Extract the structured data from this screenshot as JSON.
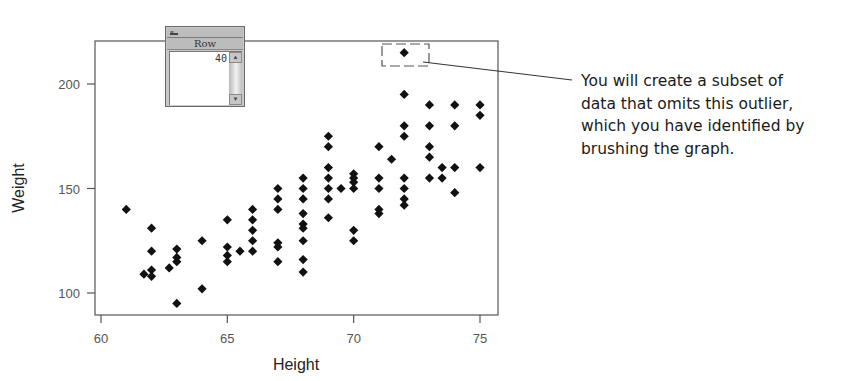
{
  "chart_data": {
    "type": "scatter",
    "title": "",
    "xlabel": "Height",
    "ylabel": "Weight",
    "xlim": [
      59.75,
      75.75
    ],
    "ylim": [
      89,
      220
    ],
    "x_ticks": [
      60,
      65,
      70,
      75
    ],
    "y_ticks": [
      100,
      150,
      200
    ],
    "grid": false,
    "legend": null,
    "marker": "diamond",
    "marker_color": "#111111",
    "points": [
      [
        61,
        140
      ],
      [
        62,
        131
      ],
      [
        62,
        120
      ],
      [
        61.7,
        109
      ],
      [
        62,
        111
      ],
      [
        62,
        108
      ],
      [
        62.7,
        112
      ],
      [
        63,
        121
      ],
      [
        63,
        117
      ],
      [
        63,
        115
      ],
      [
        63,
        95
      ],
      [
        64,
        125
      ],
      [
        64,
        102
      ],
      [
        65,
        135
      ],
      [
        65,
        122
      ],
      [
        65,
        118
      ],
      [
        65,
        115
      ],
      [
        65.5,
        120
      ],
      [
        66,
        140
      ],
      [
        66,
        135
      ],
      [
        66,
        130
      ],
      [
        66,
        125
      ],
      [
        66,
        120
      ],
      [
        67,
        150
      ],
      [
        67,
        145
      ],
      [
        67,
        140
      ],
      [
        67,
        124
      ],
      [
        67,
        122
      ],
      [
        67,
        115
      ],
      [
        68,
        155
      ],
      [
        68,
        150
      ],
      [
        68,
        145
      ],
      [
        68,
        138
      ],
      [
        68,
        133
      ],
      [
        68,
        131
      ],
      [
        68,
        125
      ],
      [
        68,
        116
      ],
      [
        68,
        110
      ],
      [
        69,
        175
      ],
      [
        69,
        170
      ],
      [
        69,
        160
      ],
      [
        69,
        155
      ],
      [
        69,
        150
      ],
      [
        69,
        145
      ],
      [
        69,
        136
      ],
      [
        69.5,
        150
      ],
      [
        70,
        157
      ],
      [
        70,
        155
      ],
      [
        70,
        153
      ],
      [
        70,
        150
      ],
      [
        70,
        130
      ],
      [
        70,
        125
      ],
      [
        71,
        170
      ],
      [
        71,
        155
      ],
      [
        71,
        150
      ],
      [
        71,
        140
      ],
      [
        71,
        138
      ],
      [
        71.5,
        164
      ],
      [
        72,
        195
      ],
      [
        72,
        180
      ],
      [
        72,
        175
      ],
      [
        72,
        155
      ],
      [
        72,
        150
      ],
      [
        72,
        145
      ],
      [
        72,
        142
      ],
      [
        73,
        190
      ],
      [
        73,
        180
      ],
      [
        73,
        170
      ],
      [
        73,
        165
      ],
      [
        73,
        155
      ],
      [
        73.5,
        160
      ],
      [
        73.5,
        155
      ],
      [
        74,
        190
      ],
      [
        74,
        180
      ],
      [
        74,
        160
      ],
      [
        74,
        148
      ],
      [
        75,
        190
      ],
      [
        75,
        185
      ],
      [
        75,
        160
      ]
    ],
    "highlighted_points": [
      {
        "x": 72,
        "y": 215,
        "row": 40,
        "label": "outlier"
      }
    ],
    "annotations": [
      {
        "target": "outlier",
        "text": "You will create a subset of data that omits this outlier, which you have identified by brushing the graph."
      }
    ]
  },
  "row_window": {
    "title": "Row",
    "menu_glyph": "=",
    "value": "40",
    "scroll_up_glyph": "▲",
    "scroll_down_glyph": "▼"
  },
  "callout": {
    "lines": [
      "You will create a subset of",
      "data that omits this outlier,",
      "which you have identified by",
      "brushing the graph."
    ]
  }
}
